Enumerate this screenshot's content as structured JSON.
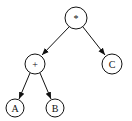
{
  "diagram": {
    "type": "expression-tree",
    "nodes": [
      {
        "id": "root",
        "label": "*",
        "cx": 76,
        "cy": 18,
        "r": 11
      },
      {
        "id": "plus",
        "label": "+",
        "cx": 35,
        "cy": 64,
        "r": 10
      },
      {
        "id": "c",
        "label": "C",
        "cx": 112,
        "cy": 64,
        "r": 10
      },
      {
        "id": "a",
        "label": "A",
        "cx": 15,
        "cy": 108,
        "r": 9
      },
      {
        "id": "b",
        "label": "B",
        "cx": 55,
        "cy": 108,
        "r": 9
      }
    ],
    "edges": [
      {
        "from": "root",
        "to": "plus"
      },
      {
        "from": "root",
        "to": "c"
      },
      {
        "from": "plus",
        "to": "a"
      },
      {
        "from": "plus",
        "to": "b"
      }
    ]
  }
}
